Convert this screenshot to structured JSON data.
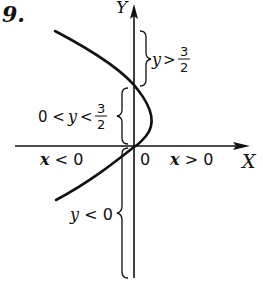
{
  "problem_number": "9.",
  "axes": {
    "x_label": "X",
    "y_label": "Y",
    "origin_label": "0"
  },
  "regions": {
    "x_negative": "x < 0",
    "x_positive": "x > 0",
    "y_above": {
      "text": "y >",
      "frac_num": "3",
      "frac_den": "2"
    },
    "y_between": {
      "prefix": "0 <",
      "var": "y",
      "op": "<",
      "frac_num": "3",
      "frac_den": "2"
    },
    "y_negative": "y < 0"
  },
  "colors": {
    "ink": "#111111",
    "background": "#ffffff"
  }
}
